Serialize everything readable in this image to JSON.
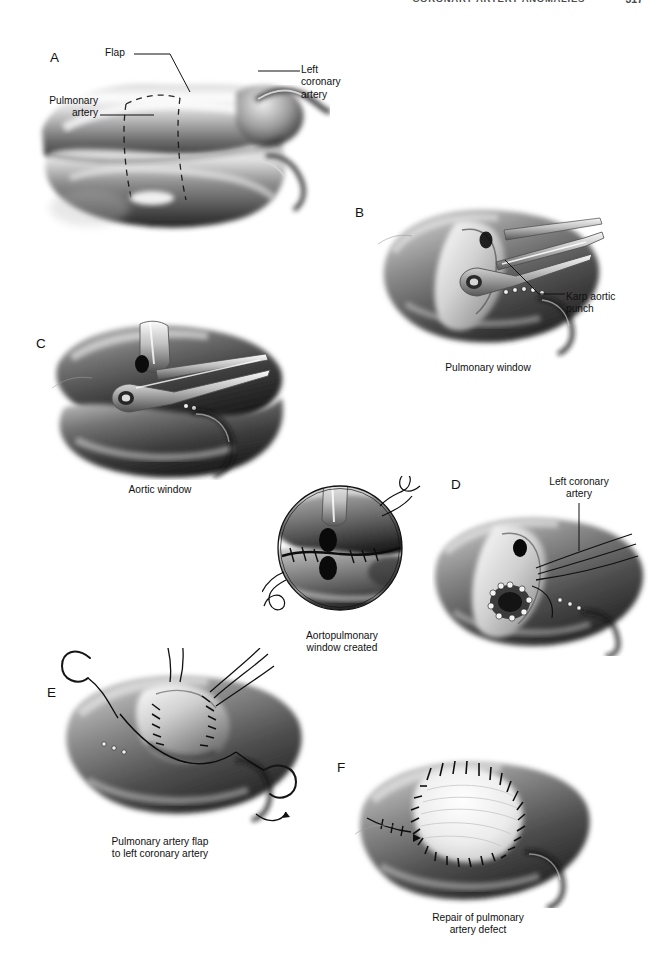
{
  "running_head": {
    "title": "CORONARY ARTERY ANOMALIES",
    "page_number": "317"
  },
  "figure": {
    "type": "surgical-illustration-plate",
    "style": "grayscale airbrush medical illustration",
    "panels": [
      {
        "letter": "A",
        "caption": "",
        "labels": [
          {
            "name": "flap",
            "text": "Flap"
          },
          {
            "name": "left-coronary-artery",
            "text": "Left\ncoronary\nartery"
          },
          {
            "name": "pulmonary-artery",
            "text": "Pulmonary\nartery"
          }
        ],
        "description": "Pulmonary artery and aorta with dashed outline of the pulmonary artery flap to be raised"
      },
      {
        "letter": "B",
        "caption": "Pulmonary window",
        "labels": [
          {
            "name": "karp-aortic-punch",
            "text": "Karp aortic\npunch"
          }
        ],
        "description": "Karp aortic punch creating the pulmonary window"
      },
      {
        "letter": "C",
        "caption": "Aortic window",
        "labels": [],
        "description": "Karp aortic punch creating the aortic window"
      },
      {
        "letter": "D",
        "caption": "",
        "labels": [
          {
            "name": "left-coronary-artery",
            "text": "Left coronary\nartery"
          }
        ],
        "description": "Left coronary artery ostium with sutured aortopulmonary window"
      },
      {
        "letter": "E",
        "caption": "Pulmonary artery flap\nto left coronary artery",
        "labels": [],
        "description": "Pulmonary artery flap being sutured to form tunnel to left coronary artery"
      },
      {
        "letter": "F",
        "caption": "Repair of pulmonary\nartery defect",
        "labels": [],
        "description": "Patch repair of the pulmonary artery defect with running suture"
      }
    ],
    "inset": {
      "name": "aortopulmonary-window-inset",
      "caption": "Aortopulmonary\nwindow created",
      "description": "Circular magnified inset showing the completed aortopulmonary window with running suture"
    }
  }
}
